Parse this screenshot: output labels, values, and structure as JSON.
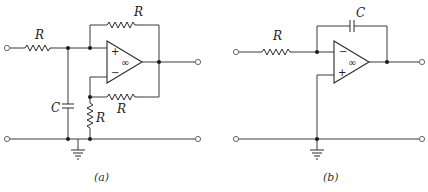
{
  "figure": {
    "panels": [
      {
        "id": "a",
        "caption": "(a)",
        "labels": {
          "input_resistor": "R",
          "feedback_resistor_top": "R",
          "feedback_resistor_bottom": "R",
          "shunt_resistor": "R",
          "capacitor": "C"
        },
        "opamp": {
          "top_input": "+",
          "bottom_input": "−",
          "gain": "∞"
        }
      },
      {
        "id": "b",
        "caption": "(b)",
        "labels": {
          "input_resistor": "R",
          "feedback_capacitor": "C"
        },
        "opamp": {
          "top_input": "−",
          "bottom_input": "+",
          "gain": "∞"
        }
      }
    ]
  }
}
